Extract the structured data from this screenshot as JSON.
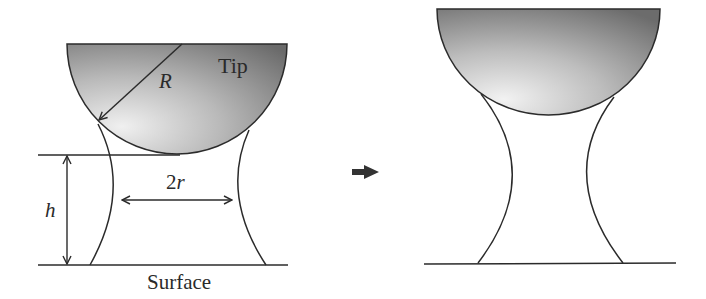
{
  "diagram": {
    "left_panel": {
      "tip_label": "Tip",
      "radius_label": "R",
      "neck_label": "2r",
      "height_label": "h",
      "surface_label": "Surface"
    },
    "transition_arrow": "right-arrow-icon",
    "right_panel": {
      "description": "Tip retracted, meniscus stretched"
    },
    "colors": {
      "stroke": "#2b2b2b",
      "tip_light": "#e8e8e8",
      "tip_dark": "#6e6e6e",
      "arrow": "#333333"
    }
  }
}
